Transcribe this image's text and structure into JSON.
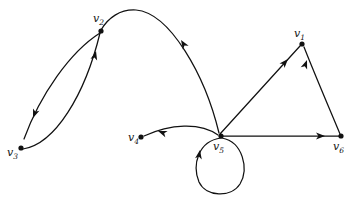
{
  "figure": {
    "type": "directed-graph-diagram",
    "background_color": "#ffffff",
    "ink_color": "#111111",
    "width": 354,
    "height": 201
  },
  "vertices": [
    {
      "id": "v1",
      "label_base": "v",
      "label_sub": "1",
      "label": "v1",
      "x": 302,
      "y": 44,
      "label_x": 294,
      "label_y": 28
    },
    {
      "id": "v2",
      "label_base": "v",
      "label_sub": "2",
      "label": "v2",
      "x": 101,
      "y": 31,
      "label_x": 93,
      "label_y": 13
    },
    {
      "id": "v3",
      "label_base": "v",
      "label_sub": "3",
      "label": "v3",
      "x": 21,
      "y": 148,
      "label_x": 7,
      "label_y": 147
    },
    {
      "id": "v4",
      "label_base": "v",
      "label_sub": "4",
      "label": "v4",
      "x": 141,
      "y": 137,
      "label_x": 128,
      "label_y": 132
    },
    {
      "id": "v5",
      "label_base": "v",
      "label_sub": "5",
      "label": "v5",
      "x": 221,
      "y": 136,
      "label_x": 213,
      "label_y": 141
    },
    {
      "id": "v6",
      "label_base": "v",
      "label_sub": "6",
      "label": "v6",
      "x": 341,
      "y": 136,
      "label_x": 333,
      "label_y": 141
    }
  ],
  "edges": [
    {
      "id": "e-v2-v3",
      "from": "v2",
      "to": "v3",
      "shape": "curve-left",
      "path": "M 100 33 C 70 52 40 95 24 139",
      "arrow": {
        "x": 33,
        "y": 118,
        "angle": 111
      }
    },
    {
      "id": "e-v3-v2",
      "from": "v3",
      "to": "v2",
      "shape": "curve-right",
      "path": "M 23 149 C 55 144 85 95 100 33",
      "arrow": {
        "x": 96,
        "y": 51,
        "angle": -76
      }
    },
    {
      "id": "e-v5-v2",
      "from": "v5",
      "to": "v2",
      "shape": "arc-over",
      "path": "M 219 133 C 205 75 170 13 136 10 C 120 9 108 18 101 30",
      "arrow": {
        "x": 181,
        "y": 40,
        "angle": -122
      }
    },
    {
      "id": "e-v5-v4",
      "from": "v5",
      "to": "v4",
      "shape": "arc-slight",
      "path": "M 218 135 C 200 122 170 124 144 136",
      "arrow": {
        "x": 158,
        "y": 131,
        "angle": 200
      }
    },
    {
      "id": "e-v5-v1",
      "from": "v5",
      "to": "v1",
      "shape": "straight",
      "path": "M 220 134 L 300 46",
      "arrow": {
        "x": 288,
        "y": 59,
        "angle": -48
      }
    },
    {
      "id": "e-v5-v6",
      "from": "v5",
      "to": "v6",
      "shape": "straight",
      "path": "M 223 136 L 339 136",
      "arrow": {
        "x": 325,
        "y": 136,
        "angle": 0
      }
    },
    {
      "id": "e-v6-v1",
      "from": "v6",
      "to": "v1",
      "shape": "curve",
      "path": "M 340 134 C 330 110 315 75 304 47",
      "arrow": {
        "x": 307,
        "y": 60,
        "angle": -70
      }
    },
    {
      "id": "e-v5-v5",
      "from": "v5",
      "to": "v5",
      "shape": "self-loop",
      "path": "M 221 138 C 198 141 192 165 199 182 C 206 197 231 198 240 184 C 249 169 243 142 222 138",
      "arrow": {
        "x": 200,
        "y": 150,
        "angle": -80
      }
    }
  ]
}
